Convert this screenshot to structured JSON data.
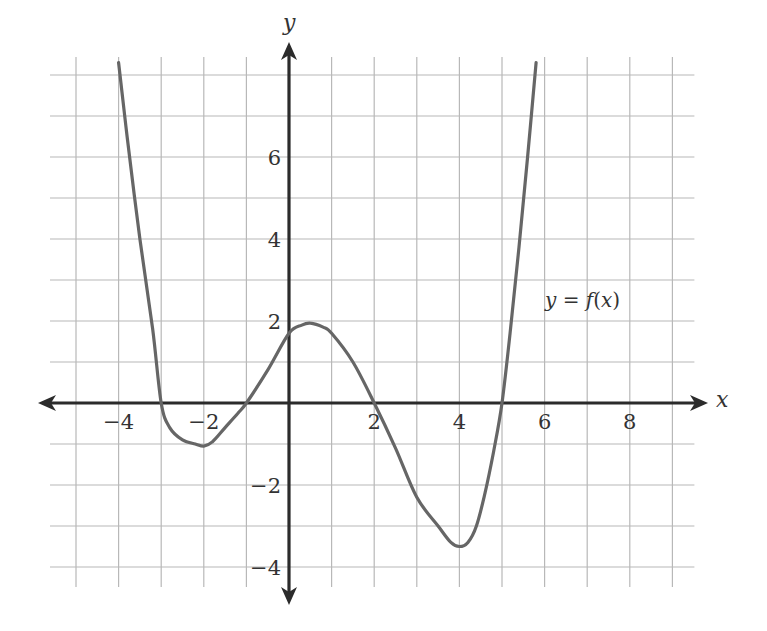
{
  "chart_data": {
    "type": "line",
    "title": "",
    "xlabel": "x",
    "ylabel": "y",
    "xlim": [
      -5,
      9
    ],
    "ylim": [
      -4,
      8
    ],
    "grid": true,
    "x_ticks": [
      -4,
      -2,
      2,
      4,
      6,
      8
    ],
    "y_ticks": [
      -4,
      -2,
      2,
      4,
      6
    ],
    "x_tick_labels": [
      "−4",
      "−2",
      "2",
      "4",
      "6",
      "8"
    ],
    "y_tick_labels": [
      "−4",
      "−2",
      "2",
      "4",
      "6"
    ],
    "series": [
      {
        "name": "y = f(x)",
        "x": [
          -4.0,
          -3.8,
          -3.5,
          -3.2,
          -3.0,
          -2.8,
          -2.5,
          -2.2,
          -2.0,
          -1.8,
          -1.5,
          -1.2,
          -1.0,
          -0.5,
          0.0,
          0.3,
          0.5,
          0.8,
          1.0,
          1.5,
          2.0,
          2.5,
          3.0,
          3.5,
          3.8,
          4.0,
          4.2,
          4.4,
          4.6,
          4.8,
          5.0,
          5.2,
          5.4,
          5.6,
          5.8
        ],
        "values": [
          8.3,
          6.5,
          4.0,
          1.8,
          0.0,
          -0.6,
          -0.9,
          -1.0,
          -1.05,
          -0.95,
          -0.6,
          -0.25,
          0.0,
          0.8,
          1.7,
          1.9,
          1.95,
          1.85,
          1.7,
          1.0,
          0.0,
          -1.1,
          -2.3,
          -3.0,
          -3.4,
          -3.5,
          -3.4,
          -3.0,
          -2.2,
          -1.2,
          0.0,
          1.8,
          3.8,
          6.0,
          8.3
        ]
      }
    ],
    "key_points": {
      "roots": [
        -3,
        -1,
        2,
        5
      ],
      "local_min_1": [
        -2,
        -1
      ],
      "local_max": [
        0.5,
        1.95
      ],
      "local_min_2": [
        4,
        -3.5
      ],
      "y_intercept": 1.7
    },
    "annotations": [
      {
        "text": "y = f(x)",
        "x": 7.3,
        "y": 2.5
      }
    ]
  },
  "labels": {
    "x_axis": "x",
    "y_axis": "y",
    "curve": "y = f(x)"
  },
  "colors": {
    "curve": "#666666",
    "axis": "#2b2b2b",
    "grid": "#b8b8b8"
  }
}
